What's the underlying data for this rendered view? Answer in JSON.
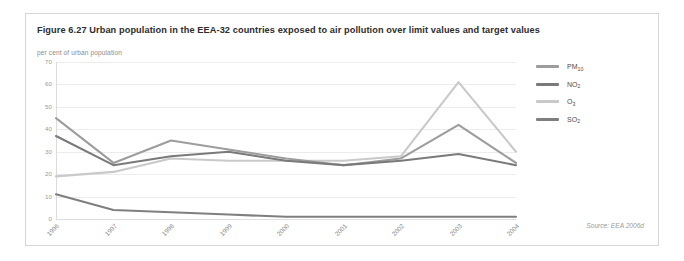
{
  "figure": {
    "title": "Figure 6.27 Urban population in the EEA-32 countries exposed to air pollution over limit values and target values",
    "source": "Source: EEA 2006d"
  },
  "chart_data": {
    "type": "line",
    "title": "Figure 6.27 Urban population in the EEA-32 countries exposed to air pollution over limit values and target values",
    "subtitle": "per cent of urban population",
    "xlabel": "",
    "ylabel": "per cent of urban population",
    "categories": [
      "1996",
      "1997",
      "1998",
      "1999",
      "2000",
      "2001",
      "2002",
      "2003",
      "2004"
    ],
    "x": [
      1996,
      1997,
      1998,
      1999,
      2000,
      2001,
      2002,
      2003,
      2004
    ],
    "ylim": [
      0,
      70
    ],
    "yticks": [
      0,
      10,
      20,
      30,
      40,
      50,
      60,
      70
    ],
    "grid": true,
    "legend_position": "right",
    "series": [
      {
        "name": "PM10",
        "label_main": "PM",
        "label_sub": "10",
        "color": "#9d9d9d",
        "values": [
          45,
          25,
          35,
          31,
          27,
          24,
          27,
          42,
          25
        ]
      },
      {
        "name": "NO2",
        "label_main": "NO",
        "label_sub": "2",
        "color": "#7a7a7a",
        "values": [
          37,
          24,
          28,
          30,
          26,
          24,
          26,
          29,
          24
        ]
      },
      {
        "name": "O3",
        "label_main": "O",
        "label_sub": "3",
        "color": "#c9c9c9",
        "values": [
          19,
          21,
          27,
          26,
          26,
          26,
          28,
          61,
          30
        ]
      },
      {
        "name": "SO2",
        "label_main": "SO",
        "label_sub": "2",
        "color": "#7f7f7f",
        "values": [
          11,
          4,
          3,
          2,
          1,
          1,
          1,
          1,
          1
        ]
      }
    ]
  }
}
